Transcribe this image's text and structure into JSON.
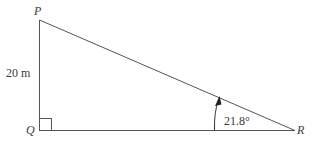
{
  "diagram": {
    "type": "right-triangle",
    "vertices": {
      "P": {
        "label": "P"
      },
      "Q": {
        "label": "Q"
      },
      "R": {
        "label": "R"
      }
    },
    "side_PQ_label": "20 m",
    "angle_R_label": "21.8°",
    "right_angle_at": "Q",
    "colors": {
      "line": "#555555",
      "text": "#3a3a3a"
    }
  }
}
